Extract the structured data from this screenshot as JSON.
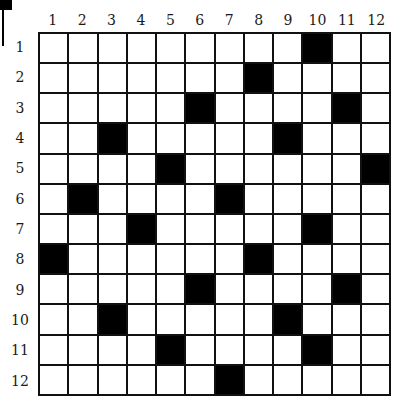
{
  "puzzle": {
    "columns": [
      "1",
      "2",
      "3",
      "4",
      "5",
      "6",
      "7",
      "8",
      "9",
      "10",
      "11",
      "12"
    ],
    "rows": [
      "1",
      "2",
      "3",
      "4",
      "5",
      "6",
      "7",
      "8",
      "9",
      "10",
      "11",
      "12"
    ],
    "black_cells": [
      [
        1,
        10
      ],
      [
        2,
        8
      ],
      [
        3,
        6
      ],
      [
        3,
        11
      ],
      [
        4,
        3
      ],
      [
        4,
        9
      ],
      [
        5,
        5
      ],
      [
        5,
        12
      ],
      [
        6,
        2
      ],
      [
        6,
        7
      ],
      [
        7,
        4
      ],
      [
        7,
        10
      ],
      [
        8,
        1
      ],
      [
        8,
        8
      ],
      [
        9,
        6
      ],
      [
        9,
        11
      ],
      [
        10,
        3
      ],
      [
        10,
        9
      ],
      [
        11,
        5
      ],
      [
        11,
        10
      ],
      [
        12,
        7
      ]
    ],
    "colors": {
      "black_cell": "#000000",
      "white_cell": "#ffffff",
      "grid_line": "#111111"
    }
  }
}
